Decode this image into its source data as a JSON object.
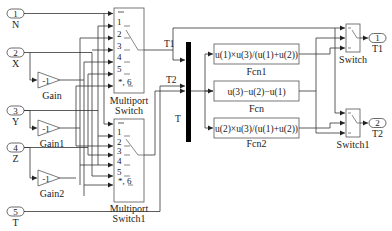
{
  "diagram": {
    "type": "simulink-block-diagram",
    "inports": [
      {
        "number": "1",
        "name": "N"
      },
      {
        "number": "2",
        "name": "X"
      },
      {
        "number": "3",
        "name": "Y"
      },
      {
        "number": "4",
        "name": "Z"
      },
      {
        "number": "5",
        "name": "T"
      }
    ],
    "gains": [
      {
        "value": "-1",
        "name": "Gain"
      },
      {
        "value": "-1",
        "name": "Gain1"
      },
      {
        "value": "-1",
        "name": "Gain2"
      }
    ],
    "multiport_switches": [
      {
        "name_line1": "Multiport",
        "name_line2": "Switch",
        "ports": [
          "1",
          "2",
          "3",
          "4",
          "5",
          "*, 6"
        ]
      },
      {
        "name_line1": "Multiport",
        "name_line2": "Switch1",
        "ports": [
          "1",
          "2",
          "3",
          "4",
          "5",
          "*, 6"
        ]
      }
    ],
    "signals": {
      "t1": "T1",
      "t2": "T2",
      "t": "T"
    },
    "functions": [
      {
        "expr": "u(1)×u(3)/(u(1)+u(2))",
        "name": "Fcn1"
      },
      {
        "expr": "u(3)−u(2)−u(1)",
        "name": "Fcn"
      },
      {
        "expr": "u(2)×u(3)/(u(1)+u(2))",
        "name": "Fcn2"
      }
    ],
    "switches": [
      {
        "name": "Switch"
      },
      {
        "name": "Switch1"
      }
    ],
    "outports": [
      {
        "number": "1",
        "name": "T1"
      },
      {
        "number": "2",
        "name": "T2"
      }
    ]
  }
}
